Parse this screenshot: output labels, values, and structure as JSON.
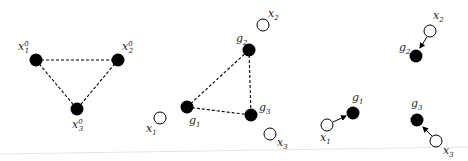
{
  "panels": [
    {
      "id": "initial-configuration",
      "nodes": [
        {
          "label": "x",
          "sub": "1",
          "sup": "0",
          "type": "filled"
        },
        {
          "label": "x",
          "sub": "2",
          "sup": "0",
          "type": "filled"
        },
        {
          "label": "x",
          "sub": "3",
          "sup": "0",
          "type": "filled"
        }
      ],
      "edges": "dashed triangle"
    },
    {
      "id": "goal-and-agents",
      "nodes": [
        {
          "label": "g",
          "sub": "1",
          "type": "filled"
        },
        {
          "label": "g",
          "sub": "2",
          "type": "filled"
        },
        {
          "label": "g",
          "sub": "3",
          "type": "filled"
        },
        {
          "label": "x",
          "sub": "1",
          "type": "hollow"
        },
        {
          "label": "x",
          "sub": "2",
          "type": "hollow"
        },
        {
          "label": "x",
          "sub": "3",
          "type": "hollow"
        }
      ],
      "edges": "dashed triangle between goals"
    },
    {
      "id": "assignment",
      "nodes": [
        {
          "label": "g",
          "sub": "1",
          "type": "filled"
        },
        {
          "label": "g",
          "sub": "2",
          "type": "filled"
        },
        {
          "label": "g",
          "sub": "3",
          "type": "filled"
        },
        {
          "label": "x",
          "sub": "1",
          "type": "hollow"
        },
        {
          "label": "x",
          "sub": "2",
          "type": "hollow"
        },
        {
          "label": "x",
          "sub": "3",
          "type": "hollow"
        }
      ],
      "edges": "arrows from x_i to g_i"
    }
  ],
  "labels": {
    "p1_x1": "x",
    "p1_x1_sub": "1",
    "p1_x1_sup": "0",
    "p1_x2": "x",
    "p1_x2_sub": "2",
    "p1_x2_sup": "0",
    "p1_x3": "x",
    "p1_x3_sub": "3",
    "p1_x3_sup": "0",
    "g": "g",
    "x": "x",
    "s1": "1",
    "s2": "2",
    "s3": "3"
  },
  "colors": {
    "node_fill": "#000000",
    "hollow_stroke": "#000000",
    "hollow_fill": "#ffffff",
    "baseline": "#e6e6e6"
  }
}
